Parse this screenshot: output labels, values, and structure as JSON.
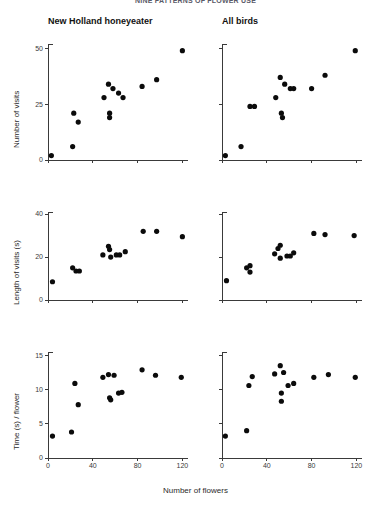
{
  "figure": {
    "title": "NINE PATTERNS OF FLOWER USE",
    "x_axis_label": "Number of flowers",
    "columns": [
      {
        "label": "New Holland honeyeater"
      },
      {
        "label": "All birds"
      }
    ]
  },
  "chart_data": [
    {
      "type": "scatter",
      "title": "New Holland honeyeater",
      "xlabel": "Number of flowers",
      "ylabel": "Number of visits",
      "xlim": [
        0,
        125
      ],
      "ylim": [
        0,
        52
      ],
      "xticks": [
        0,
        40,
        80,
        120
      ],
      "yticks": [
        0,
        25,
        50
      ],
      "grid": false,
      "legend": "none",
      "points": [
        {
          "x": 3,
          "y": 2
        },
        {
          "x": 22,
          "y": 6
        },
        {
          "x": 23,
          "y": 21
        },
        {
          "x": 27,
          "y": 17
        },
        {
          "x": 50,
          "y": 28
        },
        {
          "x": 54,
          "y": 34
        },
        {
          "x": 55,
          "y": 19
        },
        {
          "x": 55,
          "y": 21
        },
        {
          "x": 58,
          "y": 32
        },
        {
          "x": 63,
          "y": 30
        },
        {
          "x": 67,
          "y": 28
        },
        {
          "x": 84,
          "y": 33
        },
        {
          "x": 97,
          "y": 36
        },
        {
          "x": 120,
          "y": 49
        }
      ]
    },
    {
      "type": "scatter",
      "title": "All birds",
      "xlabel": "Number of flowers",
      "ylabel": "Number of visits",
      "xlim": [
        0,
        125
      ],
      "ylim": [
        0,
        52
      ],
      "xticks": [
        0,
        40,
        80,
        120
      ],
      "yticks": [
        0,
        25,
        50
      ],
      "grid": false,
      "legend": "none",
      "points": [
        {
          "x": 3,
          "y": 2
        },
        {
          "x": 17,
          "y": 6
        },
        {
          "x": 25,
          "y": 24
        },
        {
          "x": 29,
          "y": 24
        },
        {
          "x": 48,
          "y": 28
        },
        {
          "x": 52,
          "y": 37
        },
        {
          "x": 53,
          "y": 21
        },
        {
          "x": 54,
          "y": 19
        },
        {
          "x": 56,
          "y": 34
        },
        {
          "x": 61,
          "y": 32
        },
        {
          "x": 64,
          "y": 32
        },
        {
          "x": 80,
          "y": 32
        },
        {
          "x": 92,
          "y": 38
        },
        {
          "x": 119,
          "y": 49
        }
      ]
    },
    {
      "type": "scatter",
      "title": "New Holland honeyeater",
      "xlabel": "Number of flowers",
      "ylabel": "Length of visits (s)",
      "xlim": [
        0,
        125
      ],
      "ylim": [
        0,
        41
      ],
      "xticks": [
        0,
        40,
        80,
        120
      ],
      "yticks": [
        0,
        20,
        40
      ],
      "grid": false,
      "legend": "none",
      "points": [
        {
          "x": 4,
          "y": 8.5
        },
        {
          "x": 22,
          "y": 15
        },
        {
          "x": 25,
          "y": 13.5
        },
        {
          "x": 28,
          "y": 13.5
        },
        {
          "x": 49,
          "y": 21
        },
        {
          "x": 54,
          "y": 25
        },
        {
          "x": 55,
          "y": 23.5
        },
        {
          "x": 56,
          "y": 20
        },
        {
          "x": 61,
          "y": 21
        },
        {
          "x": 64,
          "y": 21
        },
        {
          "x": 69,
          "y": 22.5
        },
        {
          "x": 85,
          "y": 32
        },
        {
          "x": 97,
          "y": 32
        },
        {
          "x": 120,
          "y": 29.5
        }
      ]
    },
    {
      "type": "scatter",
      "title": "All birds",
      "xlabel": "Number of flowers",
      "ylabel": "Length of visits (s)",
      "xlim": [
        0,
        125
      ],
      "ylim": [
        0,
        41
      ],
      "xticks": [
        0,
        40,
        80,
        120
      ],
      "yticks": [
        0,
        20,
        40
      ],
      "grid": false,
      "legend": "none",
      "points": [
        {
          "x": 4,
          "y": 9
        },
        {
          "x": 22,
          "y": 15
        },
        {
          "x": 25,
          "y": 16
        },
        {
          "x": 25,
          "y": 13
        },
        {
          "x": 47,
          "y": 21.5
        },
        {
          "x": 50,
          "y": 24
        },
        {
          "x": 52,
          "y": 25.5
        },
        {
          "x": 52,
          "y": 19.5
        },
        {
          "x": 58,
          "y": 20.5
        },
        {
          "x": 61,
          "y": 20.5
        },
        {
          "x": 64,
          "y": 22
        },
        {
          "x": 82,
          "y": 31
        },
        {
          "x": 92,
          "y": 30.5
        },
        {
          "x": 118,
          "y": 30
        }
      ]
    },
    {
      "type": "scatter",
      "title": "New Holland honeyeater",
      "xlabel": "Number of flowers",
      "ylabel": "Time (s) / flower",
      "xlim": [
        0,
        125
      ],
      "ylim": [
        0,
        15.5
      ],
      "xticks": [
        0,
        40,
        80,
        120
      ],
      "yticks": [
        0,
        5,
        10,
        15
      ],
      "grid": false,
      "legend": "none",
      "points": [
        {
          "x": 4,
          "y": 3.2
        },
        {
          "x": 21,
          "y": 3.8
        },
        {
          "x": 24,
          "y": 10.9
        },
        {
          "x": 27,
          "y": 7.8
        },
        {
          "x": 49,
          "y": 11.8
        },
        {
          "x": 54,
          "y": 12.2
        },
        {
          "x": 55,
          "y": 8.8
        },
        {
          "x": 56,
          "y": 8.5
        },
        {
          "x": 59,
          "y": 12.1
        },
        {
          "x": 63,
          "y": 9.5
        },
        {
          "x": 66,
          "y": 9.6
        },
        {
          "x": 84,
          "y": 12.9
        },
        {
          "x": 96,
          "y": 12.1
        },
        {
          "x": 119,
          "y": 11.8
        }
      ]
    },
    {
      "type": "scatter",
      "title": "All birds",
      "xlabel": "Number of flowers",
      "ylabel": "Time (s) / flower",
      "xlim": [
        0,
        125
      ],
      "ylim": [
        0,
        15.5
      ],
      "xticks": [
        0,
        40,
        80,
        120
      ],
      "yticks": [
        0,
        5,
        10,
        15
      ],
      "grid": false,
      "legend": "none",
      "points": [
        {
          "x": 3,
          "y": 3.2
        },
        {
          "x": 22,
          "y": 4.0
        },
        {
          "x": 24,
          "y": 10.6
        },
        {
          "x": 27,
          "y": 11.9
        },
        {
          "x": 47,
          "y": 12.3
        },
        {
          "x": 52,
          "y": 13.5
        },
        {
          "x": 53,
          "y": 9.5
        },
        {
          "x": 53,
          "y": 8.3
        },
        {
          "x": 55,
          "y": 12.5
        },
        {
          "x": 59,
          "y": 10.6
        },
        {
          "x": 64,
          "y": 10.9
        },
        {
          "x": 82,
          "y": 11.8
        },
        {
          "x": 95,
          "y": 12.2
        },
        {
          "x": 119,
          "y": 11.8
        }
      ]
    }
  ]
}
